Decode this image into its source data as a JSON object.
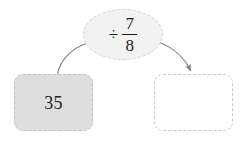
{
  "diagram": {
    "type": "function-machine",
    "background_color": "#ffffff",
    "input": {
      "label": "35",
      "fill_color": "#dedede",
      "border_color": "#c0c0c0",
      "border_style": "dashed"
    },
    "operation": {
      "symbol": "÷",
      "symbol_name": "division-sign",
      "fraction": {
        "numerator": "7",
        "denominator": "8"
      },
      "fill_color": "#f2f2f2",
      "border_color": "#cfcfcf",
      "border_style": "dashed"
    },
    "output": {
      "label": "",
      "fill_color": "#ffffff",
      "border_color": "#c9c9c9",
      "border_style": "dashed"
    },
    "connectors": [
      {
        "name": "input-to-operation",
        "from": "input",
        "to": "operation",
        "arrowhead": false,
        "color": "#808080"
      },
      {
        "name": "operation-to-output",
        "from": "operation",
        "to": "output",
        "arrowhead": true,
        "color": "#808080"
      }
    ]
  }
}
